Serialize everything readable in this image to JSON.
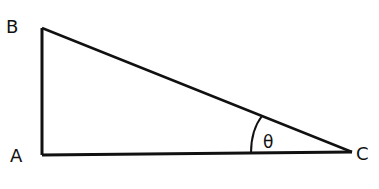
{
  "diagram": {
    "type": "right-triangle",
    "vertices": {
      "A": {
        "label": "A",
        "x": 42,
        "y": 155
      },
      "B": {
        "label": "B",
        "x": 42,
        "y": 28
      },
      "C": {
        "label": "C",
        "x": 352,
        "y": 152
      }
    },
    "angle": {
      "label": "θ",
      "at": "C"
    },
    "colors": {
      "stroke": "#111111",
      "background": "#ffffff"
    }
  }
}
